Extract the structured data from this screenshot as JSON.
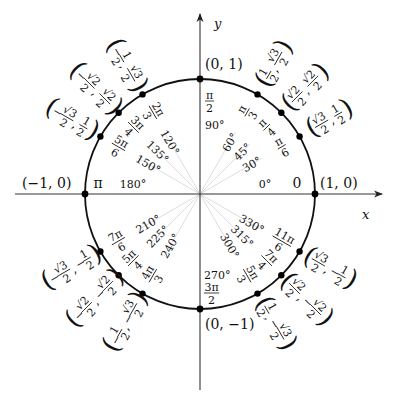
{
  "diagram": {
    "center": [
      200,
      194
    ],
    "radius": 115,
    "colors": {
      "circle": "#111111",
      "axis": "#333333",
      "ray": "#d4d4d4",
      "point": "#000000",
      "text": "#111111"
    },
    "axes": {
      "x_label": "x",
      "y_label": "y",
      "x_range_px": [
        15,
        382
      ],
      "y_range_px": [
        14,
        390
      ]
    },
    "cardinal_points": [
      {
        "angle_deg": 0,
        "coord": "(1, 0)",
        "radian": "0",
        "degree": "0°"
      },
      {
        "angle_deg": 90,
        "coord": "(0, 1)",
        "radian_num": "π",
        "radian_den": "2",
        "degree": "90°"
      },
      {
        "angle_deg": 180,
        "coord": "(−1, 0)",
        "radian": "π",
        "degree": "180°"
      },
      {
        "angle_deg": 270,
        "coord": "(0, −1)",
        "radian_num": "3π",
        "radian_den": "2",
        "degree": "270°"
      }
    ],
    "points": [
      {
        "angle_deg": 30,
        "degree": "30°",
        "radian_num": "π",
        "radian_den": "6",
        "x": {
          "num": "√3",
          "den": "2",
          "sign": ""
        },
        "y": {
          "num": "1",
          "den": "2",
          "sign": ""
        }
      },
      {
        "angle_deg": 45,
        "degree": "45°",
        "radian_num": "π",
        "radian_den": "4",
        "x": {
          "num": "√2",
          "den": "2",
          "sign": ""
        },
        "y": {
          "num": "√2",
          "den": "2",
          "sign": ""
        }
      },
      {
        "angle_deg": 60,
        "degree": "60°",
        "radian_num": "π",
        "radian_den": "3",
        "x": {
          "num": "1",
          "den": "2",
          "sign": ""
        },
        "y": {
          "num": "√3",
          "den": "2",
          "sign": ""
        }
      },
      {
        "angle_deg": 120,
        "degree": "120°",
        "radian_num": "2π",
        "radian_den": "3",
        "x": {
          "num": "1",
          "den": "2",
          "sign": "−"
        },
        "y": {
          "num": "√3",
          "den": "2",
          "sign": ""
        }
      },
      {
        "angle_deg": 135,
        "degree": "135°",
        "radian_num": "3π",
        "radian_den": "4",
        "x": {
          "num": "√2",
          "den": "2",
          "sign": "−"
        },
        "y": {
          "num": "√2",
          "den": "2",
          "sign": ""
        }
      },
      {
        "angle_deg": 150,
        "degree": "150°",
        "radian_num": "5π",
        "radian_den": "6",
        "x": {
          "num": "√3",
          "den": "2",
          "sign": "−"
        },
        "y": {
          "num": "1",
          "den": "2",
          "sign": ""
        }
      },
      {
        "angle_deg": 210,
        "degree": "210°",
        "radian_num": "7π",
        "radian_den": "6",
        "x": {
          "num": "√3",
          "den": "2",
          "sign": "−"
        },
        "y": {
          "num": "1",
          "den": "2",
          "sign": "−"
        }
      },
      {
        "angle_deg": 225,
        "degree": "225°",
        "radian_num": "5π",
        "radian_den": "4",
        "x": {
          "num": "√2",
          "den": "2",
          "sign": "−"
        },
        "y": {
          "num": "√2",
          "den": "2",
          "sign": "−"
        }
      },
      {
        "angle_deg": 240,
        "degree": "240°",
        "radian_num": "4π",
        "radian_den": "3",
        "x": {
          "num": "1",
          "den": "2",
          "sign": "−"
        },
        "y": {
          "num": "√3",
          "den": "2",
          "sign": "−"
        }
      },
      {
        "angle_deg": 300,
        "degree": "300°",
        "radian_num": "5π",
        "radian_den": "3",
        "x": {
          "num": "1",
          "den": "2",
          "sign": ""
        },
        "y": {
          "num": "√3",
          "den": "2",
          "sign": "−"
        }
      },
      {
        "angle_deg": 315,
        "degree": "315°",
        "radian_num": "7π",
        "radian_den": "4",
        "x": {
          "num": "√2",
          "den": "2",
          "sign": ""
        },
        "y": {
          "num": "√2",
          "den": "2",
          "sign": "−"
        }
      },
      {
        "angle_deg": 330,
        "degree": "330°",
        "radian_num": "11π",
        "radian_den": "6",
        "x": {
          "num": "√3",
          "den": "2",
          "sign": ""
        },
        "y": {
          "num": "1",
          "den": "2",
          "sign": "−"
        }
      }
    ]
  }
}
